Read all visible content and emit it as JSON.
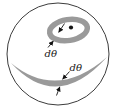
{
  "figure": {
    "labels": {
      "small_ring_width": "dθ",
      "band_width": "dθ"
    },
    "colors": {
      "band": "#9a9a9a",
      "outline": "#3c3c3c",
      "ink": "#141414",
      "background": "#ffffff"
    }
  }
}
